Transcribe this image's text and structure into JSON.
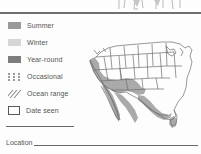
{
  "page": {
    "background_color": "#fdfdfd",
    "divider_color": "#6f6f6f"
  },
  "legend": {
    "title": "",
    "items": [
      {
        "label": "Summer",
        "swatch": "solid-swatch-summer",
        "color": "#9a9a9a"
      },
      {
        "label": "Winter",
        "swatch": "solid-swatch-winter",
        "color": "#d6d6d6"
      },
      {
        "label": "Year-round",
        "swatch": "solid-swatch-year-round",
        "color": "#7d7d7d"
      },
      {
        "label": "Occasional",
        "swatch": "dotted-swatch",
        "color": "#9a9a9a"
      },
      {
        "label": "Ocean range",
        "swatch": "hatch-swatch",
        "color": "#8e8e8e"
      },
      {
        "label": "Date seen",
        "swatch": "empty-box-swatch",
        "color": "#585858"
      }
    ]
  },
  "form": {
    "notes_rule_label": "",
    "location_label": "Location"
  },
  "map": {
    "region": "United States and Mexico range map",
    "range_shading_color": "#9b9b9b",
    "outline_color": "#6d6d6d"
  }
}
